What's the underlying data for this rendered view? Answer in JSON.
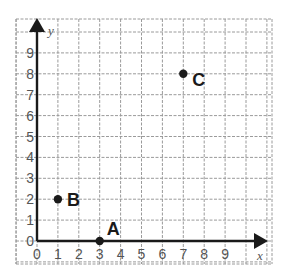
{
  "chart_data": {
    "type": "scatter",
    "title": "",
    "xlabel": "x",
    "ylabel": "y",
    "xlim": [
      -1,
      10.5
    ],
    "ylim": [
      -1,
      10.5
    ],
    "grid": true,
    "x_ticks": [
      "0",
      "1",
      "2",
      "3",
      "4",
      "5",
      "6",
      "7",
      "8",
      "9"
    ],
    "y_ticks": [
      "0",
      "1",
      "2",
      "3",
      "4",
      "5",
      "6",
      "7",
      "8",
      "9"
    ],
    "points": [
      {
        "label": "A",
        "x": 3,
        "y": 0
      },
      {
        "label": "B",
        "x": 1,
        "y": 2
      },
      {
        "label": "C",
        "x": 7,
        "y": 8
      }
    ],
    "colors": {
      "axis": "#1a1a1a",
      "grid": "#9a9a9a",
      "point": "#1a1a1a",
      "tick_text": "#555555"
    }
  }
}
